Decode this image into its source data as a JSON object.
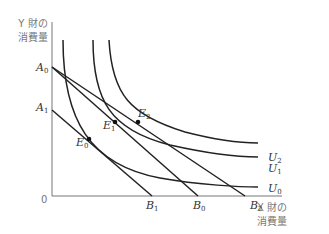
{
  "axes": {
    "y_label_line1": "Y 財の",
    "y_label_line2": "消費量",
    "x_label_line1": "X 財の",
    "x_label_line2": "消費量",
    "origin": "0"
  },
  "points": {
    "A0": {
      "letter": "A",
      "sub": "0"
    },
    "A1": {
      "letter": "A",
      "sub": "1"
    },
    "B0": {
      "letter": "B",
      "sub": "0"
    },
    "B1": {
      "letter": "B",
      "sub": "1"
    },
    "B2": {
      "letter": "B",
      "sub": "2"
    },
    "E0": {
      "letter": "E",
      "sub": "0"
    },
    "E1": {
      "letter": "E",
      "sub": "1"
    },
    "E2": {
      "letter": "E",
      "sub": "2"
    },
    "U0": {
      "letter": "U",
      "sub": "0"
    },
    "U1": {
      "letter": "U",
      "sub": "1"
    },
    "U2": {
      "letter": "U",
      "sub": "2"
    }
  },
  "colors": {
    "line": "#222222",
    "axis": "#777777"
  }
}
